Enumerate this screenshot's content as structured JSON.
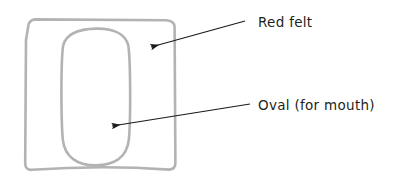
{
  "canvas": {
    "width": 393,
    "height": 180,
    "background_color": "#ffffff"
  },
  "diagram": {
    "style": "hand-drawn craft instruction sketch",
    "stroke_color": "#b3b3b3",
    "stroke_width": 2.6,
    "fill": "none",
    "shapes": [
      {
        "name": "felt-square",
        "label_ref": "Red felt",
        "shape_type": "rounded-square",
        "x": 24,
        "y": 19,
        "width": 152,
        "height": 151
      },
      {
        "name": "mouth-oval",
        "label_ref": "Oval (for mouth)",
        "shape_type": "rounded-oval",
        "x": 62,
        "y": 28,
        "width": 68,
        "height": 137
      }
    ]
  },
  "annotations": [
    {
      "id": "red-felt",
      "label": "Red felt",
      "text_x": 258,
      "text_y": 27,
      "arrow_start_x": 245,
      "arrow_start_y": 21,
      "arrow_end_x": 151,
      "arrow_end_y": 47,
      "arrow_color": "#1a1a1a",
      "target": "felt-square"
    },
    {
      "id": "mouth-oval",
      "label": "Oval (for mouth)",
      "text_x": 258,
      "text_y": 110,
      "arrow_start_x": 250,
      "arrow_start_y": 104,
      "arrow_end_x": 112,
      "arrow_end_y": 126,
      "arrow_color": "#1a1a1a",
      "target": "mouth-oval"
    }
  ],
  "colors": {
    "shape_stroke": "#b3b3b3",
    "text": "#231f20",
    "arrow": "#1a1a1a",
    "background": "#ffffff"
  }
}
